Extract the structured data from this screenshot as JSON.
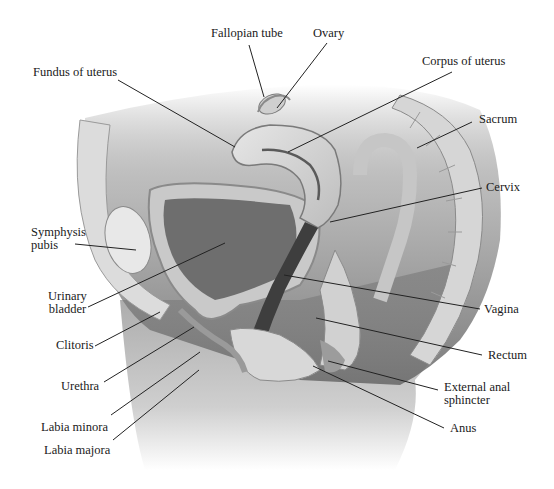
{
  "diagram": {
    "labels": {
      "fallopian_tube": "Fallopian tube",
      "ovary": "Ovary",
      "fundus": "Fundus of uterus",
      "corpus": "Corpus of uterus",
      "sacrum": "Sacrum",
      "cervix": "Cervix",
      "symphysis_1": "Symphysis",
      "symphysis_2": "pubis",
      "bladder_1": "Urinary",
      "bladder_2": "bladder",
      "vagina": "Vagina",
      "clitoris": "Clitoris",
      "rectum": "Rectum",
      "urethra": "Urethra",
      "sphincter_1": "External anal",
      "sphincter_2": "sphincter",
      "anus": "Anus",
      "labia_minora": "Labia minora",
      "labia_majora": "Labia majora"
    },
    "colors": {
      "background": "#ffffff",
      "text": "#1a1a1a",
      "leader_line": "#222222",
      "tissue_light": "#d9d9d9",
      "tissue_mid": "#a8a8a8",
      "tissue_dark": "#5a5a5a",
      "cavity": "#7a7a7a"
    }
  }
}
